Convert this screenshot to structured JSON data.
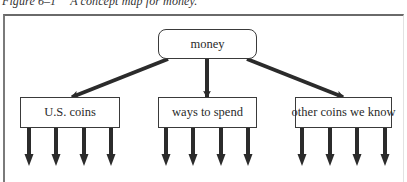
{
  "caption": {
    "figure_number": "Figure 6–1",
    "title": "A concept map for money."
  },
  "root": {
    "label": "money",
    "box": {
      "x": 158,
      "y": 29,
      "w": 99,
      "h": 30
    }
  },
  "children": [
    {
      "label": "U.S. coins",
      "box": {
        "x": 20,
        "y": 97,
        "w": 100,
        "h": 31
      },
      "leaf_arrows_x": [
        29,
        56,
        84,
        111
      ]
    },
    {
      "label": "ways to spend",
      "box": {
        "x": 158,
        "y": 97,
        "w": 99,
        "h": 31
      },
      "leaf_arrows_x": [
        166,
        193,
        221,
        248
      ]
    },
    {
      "label": "other coins we know",
      "box": {
        "x": 295,
        "y": 97,
        "w": 97,
        "h": 31
      },
      "leaf_arrows_x": [
        302,
        330,
        357,
        385
      ]
    }
  ],
  "edges": [
    {
      "from": "money",
      "to": "U.S. coins",
      "x1": 168,
      "y1": 59,
      "x2": 72,
      "y2": 97
    },
    {
      "from": "money",
      "to": "ways to spend",
      "x1": 207,
      "y1": 59,
      "x2": 207,
      "y2": 97
    },
    {
      "from": "money",
      "to": "other coins we know",
      "x1": 247,
      "y1": 59,
      "x2": 343,
      "y2": 97
    }
  ],
  "leaf_arrow": {
    "y_start": 128,
    "y_end": 166
  },
  "colors": {
    "stroke": "#2b2b2b",
    "text": "#2a2a2a",
    "frame": "#6a6a6a"
  }
}
